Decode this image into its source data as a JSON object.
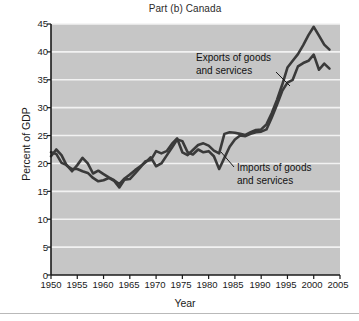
{
  "figure": {
    "title": "Part (b) Canada",
    "xlabel": "Year",
    "ylabel": "Percent of GDP",
    "annotations": {
      "exports_line1": "Exports of goods",
      "exports_line2": "and services",
      "imports_line1": "Imports of goods",
      "imports_line2": "and services"
    },
    "colors": {
      "plot_background": "#c6c6c6",
      "gridline": "#f2f2f2",
      "axis": "#1a1a1a",
      "exports_line": "#3a3a3a",
      "imports_line": "#3a3a3a",
      "page_background": "#ffffff",
      "footer_rule": "#b9b9b9"
    }
  },
  "chart_data": {
    "type": "line",
    "title": "Part (b) Canada",
    "xlabel": "Year",
    "ylabel": "Percent of GDP",
    "xlim": [
      1950,
      2005
    ],
    "ylim": [
      0,
      45
    ],
    "xticks": [
      1950,
      1955,
      1960,
      1965,
      1970,
      1975,
      1980,
      1985,
      1990,
      1995,
      2000,
      2005
    ],
    "yticks": [
      0,
      5,
      10,
      15,
      20,
      25,
      30,
      35,
      40,
      45
    ],
    "grid": "horizontal",
    "legend_position": "inline-annotations",
    "x": [
      1950,
      1951,
      1952,
      1953,
      1954,
      1955,
      1956,
      1957,
      1958,
      1959,
      1960,
      1961,
      1962,
      1963,
      1964,
      1965,
      1966,
      1967,
      1968,
      1969,
      1970,
      1971,
      1972,
      1973,
      1974,
      1975,
      1976,
      1977,
      1978,
      1979,
      1980,
      1981,
      1982,
      1983,
      1984,
      1985,
      1986,
      1987,
      1988,
      1989,
      1990,
      1991,
      1992,
      1993,
      1994,
      1995,
      1996,
      1997,
      1998,
      1999,
      2000,
      2001,
      2002,
      2003
    ],
    "series": [
      {
        "name": "Exports of goods and services",
        "values": [
          21.3,
          22.5,
          21.5,
          19.6,
          19.0,
          19.0,
          18.6,
          18.3,
          17.4,
          16.8,
          17.0,
          17.4,
          16.9,
          15.7,
          17.1,
          17.2,
          18.2,
          19.3,
          20.4,
          20.6,
          22.2,
          21.8,
          22.2,
          23.5,
          24.5,
          22.0,
          21.5,
          22.4,
          23.3,
          23.6,
          23.2,
          22.3,
          21.8,
          25.3,
          25.6,
          25.5,
          25.3,
          25.1,
          25.6,
          26.0,
          26.1,
          27.0,
          29.0,
          31.4,
          34.1,
          37.2,
          38.4,
          39.6,
          41.2,
          43.0,
          44.5,
          42.9,
          41.3,
          40.4
        ]
      },
      {
        "name": "Imports of goods and services",
        "values": [
          22.0,
          21.7,
          20.1,
          19.7,
          18.6,
          19.7,
          21.0,
          20.0,
          18.2,
          18.7,
          18.1,
          17.5,
          17.0,
          16.3,
          17.3,
          18.0,
          18.8,
          19.5,
          20.2,
          21.1,
          19.5,
          20.0,
          21.4,
          22.8,
          24.3,
          24.0,
          22.0,
          21.6,
          22.5,
          22.0,
          22.2,
          21.3,
          19.0,
          21.0,
          23.0,
          24.3,
          25.0,
          24.9,
          25.3,
          25.6,
          25.7,
          26.1,
          28.2,
          30.5,
          33.0,
          34.5,
          35.0,
          37.4,
          38.0,
          38.4,
          39.5,
          36.8,
          37.9,
          37.0
        ]
      }
    ],
    "notable_points": {
      "exports_peak": {
        "year": 2000,
        "value": 44.5
      },
      "imports_peak": {
        "year": 2000,
        "value": 39.5
      },
      "exports_trough": {
        "year": 1963,
        "value": 15.7
      },
      "imports_trough": {
        "year": 1963,
        "value": 16.3
      },
      "imports_dip_1982": {
        "year": 1982,
        "value": 19.0
      }
    }
  }
}
